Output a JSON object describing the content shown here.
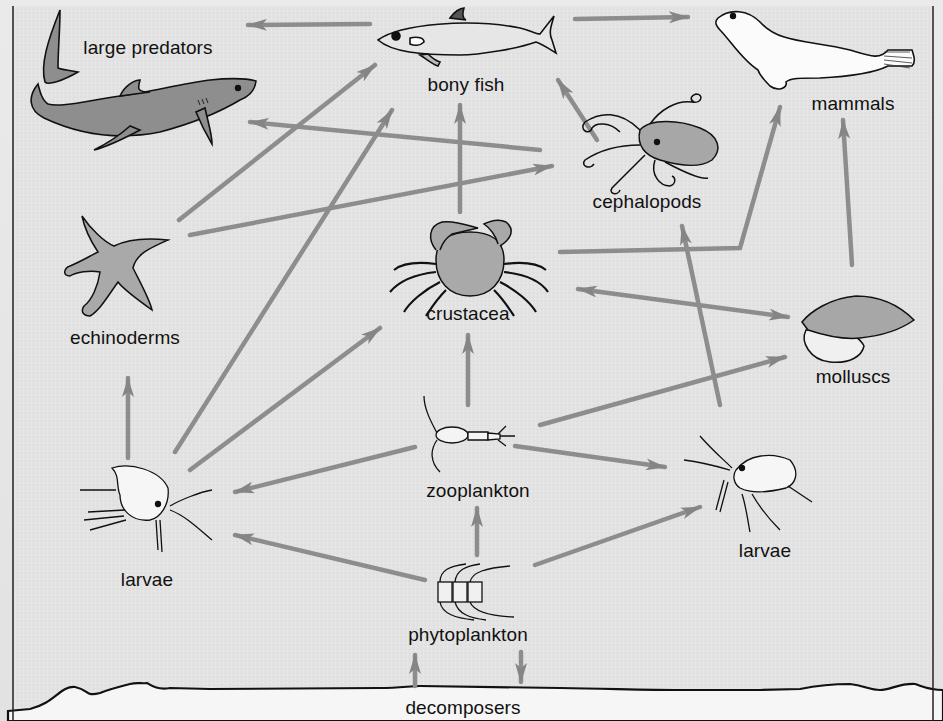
{
  "colors": {
    "background": "#e4e4e4",
    "sediment": "#f4f4f4",
    "arrow": "#8a8a8a",
    "organism_fill": "#a9a9a9",
    "outline": "#111111"
  },
  "nodes": [
    {
      "id": "large_predators",
      "label": "large predators",
      "icon": "shark-icon",
      "x": 148,
      "y": 57
    },
    {
      "id": "bony_fish",
      "label": "bony fish",
      "icon": "fish-icon",
      "x": 466,
      "y": 85
    },
    {
      "id": "mammals",
      "label": "mammals",
      "icon": "seal-icon",
      "x": 853,
      "y": 103
    },
    {
      "id": "cephalopods",
      "label": "cephalopods",
      "icon": "octopus-icon",
      "x": 647,
      "y": 201
    },
    {
      "id": "echinoderms",
      "label": "echinoderms",
      "icon": "starfish-icon",
      "x": 125,
      "y": 337
    },
    {
      "id": "crustacea",
      "label": "crustacea",
      "icon": "crab-icon",
      "x": 468,
      "y": 313
    },
    {
      "id": "molluscs",
      "label": "molluscs",
      "icon": "shell-icon",
      "x": 853,
      "y": 376
    },
    {
      "id": "zooplankton",
      "label": "zooplankton",
      "icon": "copepod-icon",
      "x": 478,
      "y": 490
    },
    {
      "id": "larvae_left",
      "label": "larvae",
      "icon": "larva-icon",
      "x": 147,
      "y": 579
    },
    {
      "id": "larvae_right",
      "label": "larvae",
      "icon": "larva-icon",
      "x": 765,
      "y": 550
    },
    {
      "id": "phytoplankton",
      "label": "phytoplankton",
      "icon": "diatom-chain-icon",
      "x": 468,
      "y": 634
    },
    {
      "id": "decomposers",
      "label": "decomposers",
      "icon": "",
      "x": 463,
      "y": 707
    }
  ],
  "edges": [
    {
      "from": "bony_fish",
      "to": "large_predators"
    },
    {
      "from": "bony_fish",
      "to": "mammals"
    },
    {
      "from": "cephalopods",
      "to": "large_predators"
    },
    {
      "from": "cephalopods",
      "to": "bony_fish"
    },
    {
      "from": "echinoderms",
      "to": "bony_fish"
    },
    {
      "from": "echinoderms",
      "to": "cephalopods"
    },
    {
      "from": "crustacea",
      "to": "bony_fish"
    },
    {
      "from": "crustacea",
      "to": "mammals"
    },
    {
      "from": "crustacea",
      "to": "molluscs",
      "bidirectional": true
    },
    {
      "from": "molluscs",
      "to": "mammals"
    },
    {
      "from": "larvae_right",
      "to": "cephalopods"
    },
    {
      "from": "larvae_left",
      "to": "echinoderms"
    },
    {
      "from": "larvae_left",
      "to": "bony_fish"
    },
    {
      "from": "larvae_left",
      "to": "crustacea"
    },
    {
      "from": "zooplankton",
      "to": "crustacea"
    },
    {
      "from": "zooplankton",
      "to": "larvae_left"
    },
    {
      "from": "zooplankton",
      "to": "larvae_right"
    },
    {
      "from": "zooplankton",
      "to": "molluscs"
    },
    {
      "from": "phytoplankton",
      "to": "zooplankton"
    },
    {
      "from": "phytoplankton",
      "to": "larvae_left"
    },
    {
      "from": "phytoplankton",
      "to": "larvae_right"
    },
    {
      "from": "decomposers",
      "to": "phytoplankton"
    },
    {
      "from": "phytoplankton",
      "to": "decomposers"
    }
  ]
}
